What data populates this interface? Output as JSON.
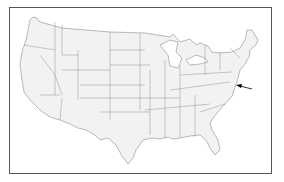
{
  "map": {
    "title": "",
    "type": "United States outline map with state borders",
    "highlight": {
      "label": "",
      "target": "Delaware / Maryland (Mid-Atlantic)",
      "marker": "arrow-icon"
    },
    "colors": {
      "land": "#f2f2f2",
      "border": "#777777",
      "frame": "#555555",
      "background": "#ffffff"
    }
  }
}
